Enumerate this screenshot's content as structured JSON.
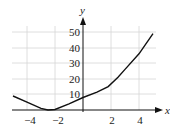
{
  "chart_data": {
    "type": "line",
    "title": "",
    "xlabel": "x",
    "ylabel": "y",
    "xlim": [
      -5,
      5
    ],
    "ylim": [
      0,
      50
    ],
    "grid": true,
    "x_ticks": [
      -4,
      -2,
      2,
      4
    ],
    "x_tick_labels": [
      "−4",
      "−2",
      "2",
      "4"
    ],
    "y_ticks": [
      10,
      20,
      30,
      40,
      50
    ],
    "y_tick_labels": [
      "10",
      "20",
      "30",
      "40",
      "50"
    ],
    "series": [
      {
        "name": "f(x)",
        "x": [
          -5,
          -4,
          -3,
          -2.5,
          -2,
          -1,
          0,
          1,
          1.8,
          2.5,
          3,
          4,
          5
        ],
        "y": [
          9,
          5,
          1,
          0,
          0.3,
          4,
          8,
          11.5,
          15,
          21,
          26,
          36,
          49
        ]
      }
    ]
  },
  "labels": {
    "x_axis": "x",
    "y_axis": "y",
    "xt0": "−4",
    "xt1": "−2",
    "xt2": "2",
    "xt3": "4",
    "yt0": "10",
    "yt1": "20",
    "yt2": "30",
    "yt3": "40",
    "yt4": "50"
  }
}
